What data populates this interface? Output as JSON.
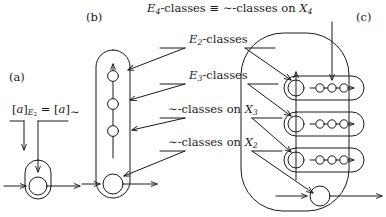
{
  "figure": {
    "title": "E4-classes ≡ ∼-classes on X4",
    "stroke_color": "#1a1a1a",
    "background_color": "#ffffff",
    "width": 386,
    "height": 217
  },
  "panels": [
    {
      "tag": "(a)",
      "name": "panel-a"
    },
    {
      "tag": "(b)",
      "name": "panel-b"
    },
    {
      "tag": "(c)",
      "name": "panel-c"
    }
  ],
  "title": {
    "lead": "E",
    "lead_sub": "4",
    "mid": "-classes ≡ ∼-classes on ",
    "var": "X",
    "var_sub": "4"
  },
  "equation": {
    "open1": "[",
    "a1": "a",
    "close1": "]",
    "sub1_e": "E",
    "sub1_n": "2",
    "eq": " = ",
    "open2": "[",
    "a2": "a",
    "close2": "]",
    "sub2": "∼"
  },
  "callouts": [
    {
      "id": "callout-e2-classes",
      "lead": "E",
      "lead_sub": "2",
      "rest": "-classes",
      "target": "panel-c-row-1"
    },
    {
      "id": "callout-e3-classes",
      "lead": "E",
      "lead_sub": "3",
      "rest": "-classes",
      "target": "panel-c-row-2"
    },
    {
      "id": "callout-tilde-classes-x3",
      "lead": "∼-classes on ",
      "var": "X",
      "var_sub": "3",
      "rest": "",
      "target": "panel-c-row-3"
    },
    {
      "id": "callout-tilde-classes-x2",
      "lead": "∼-classes on ",
      "var": "X",
      "var_sub": "2",
      "rest": "",
      "target": "panel-c-bottom-node"
    }
  ],
  "panel_a": {
    "name": "panel-a",
    "description": "single node with self-loop stadium and horizontal through-arrow",
    "node_count": 1
  },
  "panel_b": {
    "name": "panel-b",
    "description": "vertical stadium containing a chain of three small nodes above one large bottom node",
    "small_node_count": 3,
    "large_node_count": 1
  },
  "panel_c": {
    "name": "panel-c",
    "description": "large outer stadium containing three horizontal stadium rows and a bottom node",
    "row_count": 3,
    "nodes_per_row": 4,
    "bottom_node_count": 1
  }
}
